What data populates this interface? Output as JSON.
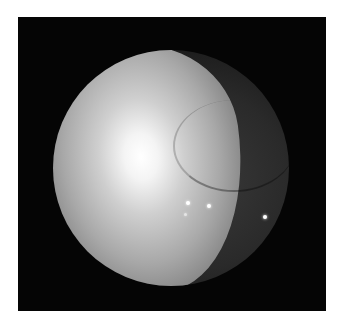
{
  "image": {
    "description": "Grayscale endoscopic view within a circular field on black background",
    "frame": {
      "x": 18,
      "y": 17,
      "width": 308,
      "height": 294,
      "color": "#050505"
    },
    "scope_circle": {
      "cx": 171,
      "cy": 168,
      "r": 118
    },
    "highlights": [
      {
        "x": 188,
        "y": 203
      },
      {
        "x": 209,
        "y": 206
      },
      {
        "x": 265,
        "y": 217
      },
      {
        "x": 186,
        "y": 215
      }
    ]
  }
}
